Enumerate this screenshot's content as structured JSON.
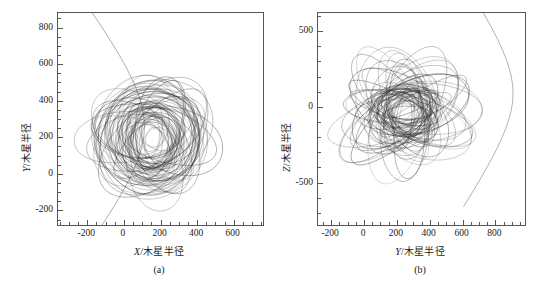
{
  "figure": {
    "background_color": "#ffffff",
    "line_color": "#2b2b2b",
    "axis_color": "#555555"
  },
  "chart_data": [
    {
      "type": "line",
      "panel_id": "a",
      "caption": "(a)",
      "title": "",
      "xlabel": "X/木星半径",
      "xlabel_italic_part": "X",
      "xlabel_rest": "/木星半径",
      "ylabel": "Y/木星半径",
      "ylabel_italic_part": "Y",
      "ylabel_rest": "/木星半径",
      "xlim": [
        -360,
        760
      ],
      "ylim": [
        -280,
        880
      ],
      "xticks": [
        -200,
        0,
        200,
        400,
        600
      ],
      "xtick_labels": [
        "-200",
        "0",
        "200",
        "400",
        "600"
      ],
      "yticks": [
        -200,
        0,
        200,
        400,
        600,
        800
      ],
      "ytick_labels": [
        "-200",
        "0",
        "200",
        "400",
        "600",
        "800"
      ],
      "x_minor_step": 50,
      "y_minor_step": 50,
      "grid": false,
      "legend": null,
      "description": "Projection of a precessing orbital trajectory onto the X-Y plane; a dense tangle of overlapping ellipses centred near (150, 200) plus an escape branch leaving the upper-left and sweeping to the lower-right.",
      "cluster": {
        "cx": 150,
        "cy": 200,
        "rx": 330,
        "ry": 420,
        "n_orbits": 70
      },
      "escape_branch": "enters at upper-left, curves right and exits lower-right"
    },
    {
      "type": "line",
      "panel_id": "b",
      "caption": "(b)",
      "title": "",
      "xlabel": "Y/木星半径",
      "xlabel_italic_part": "Y",
      "xlabel_rest": "/木星半径",
      "ylabel": "Z/木星半径",
      "ylabel_italic_part": "Z",
      "ylabel_rest": "/木星半径",
      "xlim": [
        -280,
        980
      ],
      "ylim": [
        -780,
        620
      ],
      "xticks": [
        -200,
        0,
        200,
        400,
        600,
        800
      ],
      "xtick_labels": [
        "-200",
        "0",
        "200",
        "400",
        "600",
        "800"
      ],
      "yticks": [
        -500,
        0,
        500
      ],
      "ytick_labels": [
        "-500",
        "0",
        "500"
      ],
      "x_minor_step": 50,
      "y_minor_step": 100,
      "grid": false,
      "legend": null,
      "description": "Projection of the same trajectory onto the Y-Z plane; an oblate tangle of ellipses centred near (250, -30) with an escape branch looping out to the right and descending to the lower-left.",
      "cluster": {
        "cx": 250,
        "cy": -30,
        "rx": 390,
        "ry": 330,
        "n_orbits": 70
      },
      "escape_branch": "loops far right then descends and exits lower-left"
    }
  ]
}
